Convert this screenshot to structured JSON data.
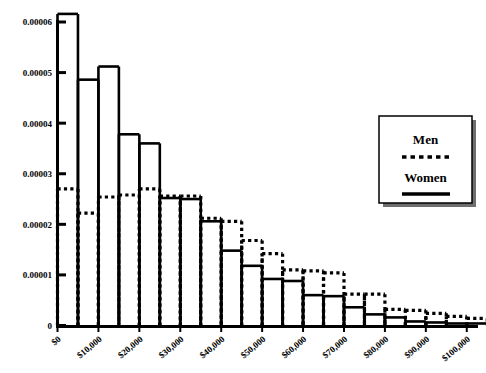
{
  "chart_data": {
    "type": "bar",
    "title": "",
    "subtitle": "",
    "xlabel": "",
    "ylabel": "",
    "xlim": [
      0,
      102500
    ],
    "ylim": [
      0,
      6e-05
    ],
    "grid": false,
    "legend_position": "right",
    "bin_width": 5000,
    "x": [
      0,
      5000,
      10000,
      15000,
      20000,
      25000,
      30000,
      35000,
      40000,
      45000,
      50000,
      55000,
      60000,
      65000,
      70000,
      75000,
      80000,
      85000,
      90000,
      95000,
      100000
    ],
    "xtick_labels": [
      "$0",
      "$10,000",
      "$20,000",
      "$30,000",
      "$40,000",
      "$50,000",
      "$60,000",
      "$70,000",
      "$80,000",
      "$90,000",
      "$100,000"
    ],
    "xtick_values": [
      0,
      10000,
      20000,
      30000,
      40000,
      50000,
      60000,
      70000,
      80000,
      90000,
      100000
    ],
    "ytick_labels": [
      "0",
      "0.00001",
      "0.00002",
      "0.00003",
      "0.00004",
      "0.00005",
      "0.00006"
    ],
    "ytick_values": [
      0,
      1e-05,
      2e-05,
      3e-05,
      4e-05,
      5e-05,
      6e-05
    ],
    "series": [
      {
        "name": "Women",
        "style": "solid",
        "color": "#000000",
        "values": [
          6.16e-05,
          4.86e-05,
          5.12e-05,
          3.78e-05,
          3.6e-05,
          2.52e-05,
          2.5e-05,
          2.06e-05,
          1.48e-05,
          1.18e-05,
          9.2e-06,
          8.8e-06,
          6e-06,
          5.8e-06,
          3.6e-06,
          2.2e-06,
          1.6e-06,
          8e-07,
          6e-07,
          4e-07,
          4e-07
        ]
      },
      {
        "name": "Men",
        "style": "dotted",
        "color": "#000000",
        "values": [
          2.7e-05,
          2.22e-05,
          2.54e-05,
          2.58e-05,
          2.7e-05,
          2.56e-05,
          2.56e-05,
          2.12e-05,
          2.06e-05,
          1.68e-05,
          1.42e-05,
          1.1e-05,
          1.08e-05,
          1.04e-05,
          6.2e-06,
          6.2e-06,
          3.2e-06,
          3e-06,
          2.4e-06,
          1.8e-06,
          1.4e-06
        ]
      }
    ]
  },
  "legend": {
    "entries": [
      {
        "label": "Men",
        "style": "dotted"
      },
      {
        "label": "Women",
        "style": "solid"
      }
    ]
  }
}
